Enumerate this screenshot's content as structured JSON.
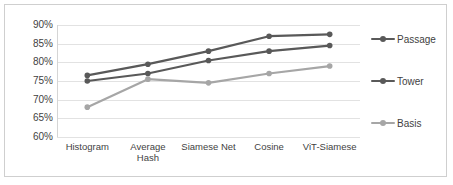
{
  "chart_data": {
    "type": "line",
    "title": "",
    "xlabel": "",
    "ylabel": "",
    "ylim": [
      60,
      90
    ],
    "ytick_labels": [
      "90%",
      "85%",
      "80%",
      "75%",
      "70%",
      "65%",
      "60%"
    ],
    "ytick_values": [
      90,
      85,
      80,
      75,
      70,
      65,
      60
    ],
    "grid": true,
    "legend_position": "right",
    "categories": [
      "Histogram",
      "Average\nHash",
      "Siamese Net",
      "Cosine",
      "ViT-Siamese"
    ],
    "series": [
      {
        "name": "Passage",
        "color": "#595959",
        "values": [
          76.5,
          79.5,
          83.0,
          87.0,
          87.5
        ]
      },
      {
        "name": "Tower",
        "color": "#595959",
        "values": [
          75.0,
          77.0,
          80.5,
          83.0,
          84.5
        ]
      },
      {
        "name": "Basis",
        "color": "#a6a6a6",
        "values": [
          68.0,
          75.5,
          74.5,
          77.0,
          79.0
        ]
      }
    ]
  },
  "legend": {
    "items": [
      {
        "label": "Passage",
        "color": "#595959"
      },
      {
        "label": "Tower",
        "color": "#595959"
      },
      {
        "label": "Basis",
        "color": "#a6a6a6"
      }
    ]
  },
  "colors": {
    "grid": "#e2e2e2",
    "frame": "#cfcfcf",
    "text": "#3f3f3f",
    "background": "#ffffff"
  }
}
